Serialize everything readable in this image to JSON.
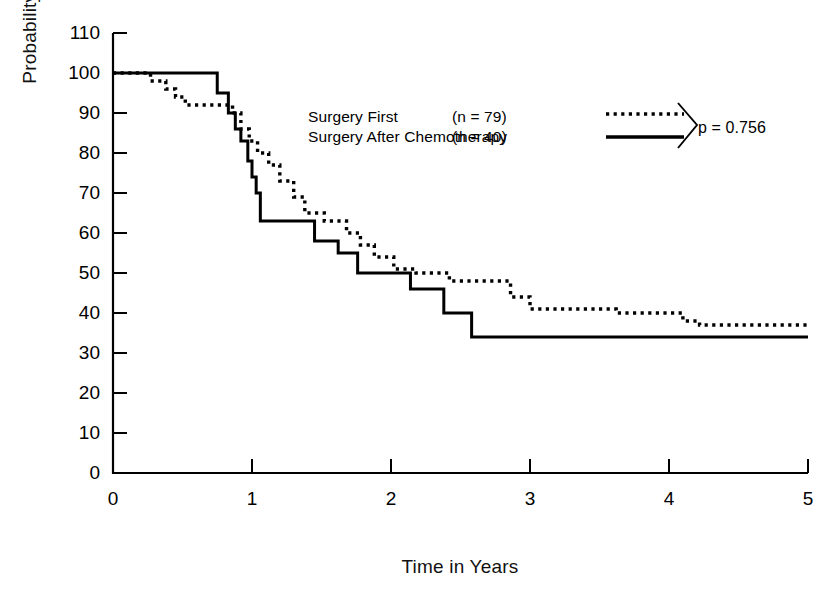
{
  "chart_data": {
    "type": "line",
    "subtype": "kaplan-meier-step",
    "title": "",
    "xlabel": "Time in Years",
    "ylabel": "Probability of Survival",
    "xlim": [
      0,
      5
    ],
    "ylim": [
      0,
      110
    ],
    "xticks": [
      "0",
      "1",
      "2",
      "3",
      "4",
      "5"
    ],
    "yticks": [
      "0",
      "10",
      "20",
      "30",
      "40",
      "50",
      "60",
      "70",
      "80",
      "90",
      "100",
      "110"
    ],
    "grid": false,
    "legend_position": "upper-center",
    "annotations": [
      "p = 0.756"
    ],
    "series": [
      {
        "name": "Surgery First",
        "n": 79,
        "linestyle": "dotted",
        "color": "#000000",
        "legend_label": "Surgery First",
        "legend_n": "(n  =  79)",
        "steps": [
          [
            0.0,
            100
          ],
          [
            0.27,
            100
          ],
          [
            0.27,
            98
          ],
          [
            0.38,
            98
          ],
          [
            0.38,
            96
          ],
          [
            0.45,
            96
          ],
          [
            0.45,
            94
          ],
          [
            0.52,
            94
          ],
          [
            0.52,
            92
          ],
          [
            0.86,
            92
          ],
          [
            0.86,
            90
          ],
          [
            0.92,
            90
          ],
          [
            0.92,
            86
          ],
          [
            0.98,
            86
          ],
          [
            0.98,
            83
          ],
          [
            1.04,
            83
          ],
          [
            1.04,
            80
          ],
          [
            1.12,
            80
          ],
          [
            1.12,
            77
          ],
          [
            1.2,
            77
          ],
          [
            1.2,
            73
          ],
          [
            1.3,
            73
          ],
          [
            1.3,
            69
          ],
          [
            1.38,
            69
          ],
          [
            1.38,
            65
          ],
          [
            1.52,
            65
          ],
          [
            1.52,
            63
          ],
          [
            1.68,
            63
          ],
          [
            1.68,
            60
          ],
          [
            1.78,
            60
          ],
          [
            1.78,
            57
          ],
          [
            1.88,
            57
          ],
          [
            1.88,
            54
          ],
          [
            2.02,
            54
          ],
          [
            2.02,
            51
          ],
          [
            2.18,
            51
          ],
          [
            2.18,
            50
          ],
          [
            2.42,
            50
          ],
          [
            2.42,
            48
          ],
          [
            2.86,
            48
          ],
          [
            2.86,
            44
          ],
          [
            3.0,
            44
          ],
          [
            3.0,
            41
          ],
          [
            3.62,
            41
          ],
          [
            3.62,
            40
          ],
          [
            4.1,
            40
          ],
          [
            4.1,
            38
          ],
          [
            4.22,
            38
          ],
          [
            4.22,
            37
          ],
          [
            5.0,
            37
          ]
        ],
        "final_value": 37
      },
      {
        "name": "Surgery After Chemotherapy",
        "n": 40,
        "linestyle": "solid",
        "color": "#000000",
        "legend_label": "Surgery After Chemotherapy",
        "legend_n": "(n  =  40)",
        "steps": [
          [
            0.0,
            100
          ],
          [
            0.75,
            100
          ],
          [
            0.75,
            95
          ],
          [
            0.83,
            95
          ],
          [
            0.83,
            90
          ],
          [
            0.88,
            90
          ],
          [
            0.88,
            86
          ],
          [
            0.92,
            86
          ],
          [
            0.92,
            83
          ],
          [
            0.97,
            83
          ],
          [
            0.97,
            78
          ],
          [
            1.0,
            78
          ],
          [
            1.0,
            74
          ],
          [
            1.03,
            74
          ],
          [
            1.03,
            70
          ],
          [
            1.06,
            70
          ],
          [
            1.06,
            63
          ],
          [
            1.45,
            63
          ],
          [
            1.45,
            58
          ],
          [
            1.62,
            58
          ],
          [
            1.62,
            55
          ],
          [
            1.76,
            55
          ],
          [
            1.76,
            50
          ],
          [
            2.14,
            50
          ],
          [
            2.14,
            46
          ],
          [
            2.38,
            46
          ],
          [
            2.38,
            40
          ],
          [
            2.58,
            40
          ],
          [
            2.58,
            34
          ],
          [
            5.0,
            34
          ]
        ],
        "final_value": 34
      }
    ],
    "p_value": "p = 0.756"
  },
  "axes": {
    "y_label": "Probability of Survival",
    "x_label": "Time in Years",
    "y_tick_labels": [
      "110",
      "100",
      "90",
      "80",
      "70",
      "60",
      "50",
      "40",
      "30",
      "20",
      "10",
      "0"
    ],
    "x_tick_labels": [
      "0",
      "1",
      "2",
      "3",
      "4",
      "5"
    ]
  },
  "legend": {
    "row1": {
      "label": "Surgery First",
      "n_text": "(n  =  79)",
      "style": "dotted"
    },
    "row2": {
      "label": "Surgery After Chemotherapy",
      "n_text": "(n  =  40)",
      "style": "solid"
    },
    "p_value": "p = 0.756",
    "brace_icon": "angle-bracket-right-icon"
  },
  "colors": {
    "ink": "#000000",
    "background": "#ffffff"
  }
}
